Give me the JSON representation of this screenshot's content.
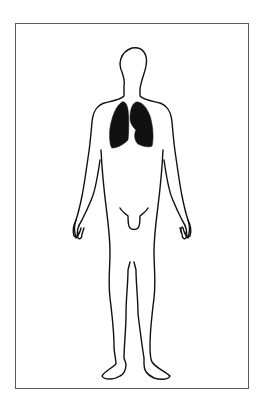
{
  "figure": {
    "highlighted_organ": "lungs",
    "colors": {
      "outline": "#111111",
      "highlight_fill": "#111111",
      "frame_border": "#5a5a5a",
      "background": "#ffffff"
    }
  }
}
